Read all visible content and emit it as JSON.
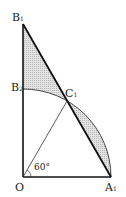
{
  "diagram": {
    "points": {
      "B1": {
        "label": "B",
        "sub": "1"
      },
      "B2": {
        "label": "B",
        "sub": "2"
      },
      "C1": {
        "label": "C",
        "sub": "1"
      },
      "O": {
        "label": "O",
        "sub": ""
      },
      "A1": {
        "label": "A",
        "sub": "1"
      }
    },
    "angle_label": "60°",
    "colors": {
      "shade": "#d9d9d9",
      "line": "#1a1a1a"
    }
  }
}
